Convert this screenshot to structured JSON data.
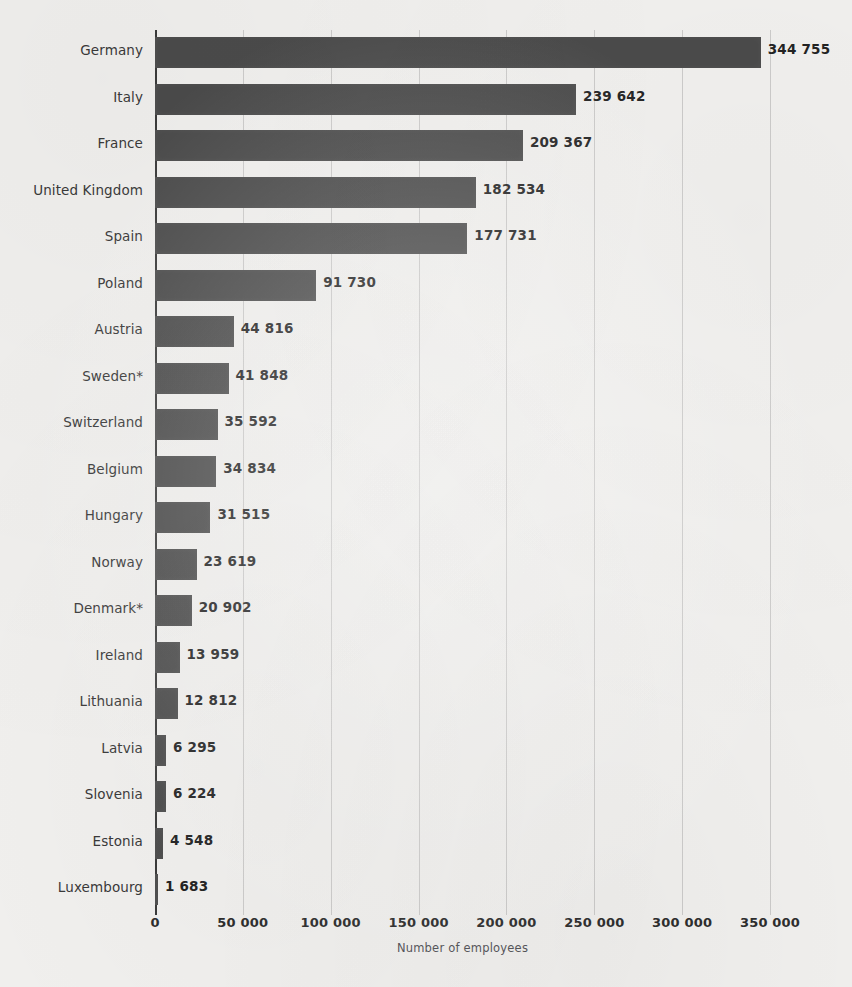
{
  "chart_data": {
    "type": "bar",
    "orientation": "horizontal",
    "title": "",
    "xlabel": "Number of employees",
    "ylabel": "",
    "xlim": [
      0,
      350000
    ],
    "grid": true,
    "legend": false,
    "categories": [
      "Germany",
      "Italy",
      "France",
      "United Kingdom",
      "Spain",
      "Poland",
      "Austria",
      "Sweden*",
      "Switzerland",
      "Belgium",
      "Hungary",
      "Norway",
      "Denmark*",
      "Ireland",
      "Lithuania",
      "Latvia",
      "Slovenia",
      "Estonia",
      "Luxembourg"
    ],
    "values": [
      344755,
      239642,
      209367,
      182534,
      177731,
      91730,
      44816,
      41848,
      35592,
      34834,
      31515,
      23619,
      20902,
      13959,
      12812,
      6295,
      6224,
      4548,
      1683
    ],
    "value_labels": [
      "344 755",
      "239 642",
      "209 367",
      "182 534",
      "177 731",
      "91 730",
      "44 816",
      "41 848",
      "35 592",
      "34 834",
      "31 515",
      "23 619",
      "20 902",
      "13 959",
      "12 812",
      "6 295",
      "6 224",
      "4 548",
      "1 683"
    ],
    "xticks": [
      0,
      50000,
      100000,
      150000,
      200000,
      250000,
      300000,
      350000
    ],
    "xtick_labels": [
      "0",
      "50 000",
      "100 000",
      "150 000",
      "200 000",
      "250 000",
      "300 000",
      "350 000"
    ],
    "bar_color": "#4b4b4b",
    "background_color": "#f2f1ef",
    "gridline_color": "#787878",
    "axis_color": "#3b3b3b",
    "label_color": "#3a3a3a"
  }
}
